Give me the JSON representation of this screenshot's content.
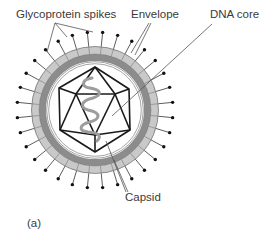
{
  "diagram": {
    "panel_label": "(a)",
    "labels": {
      "glycoprotein_spikes": "Glycoprotein spikes",
      "envelope": "Envelope",
      "dna_core": "DNA core",
      "capsid": "Capsid"
    },
    "components": [
      {
        "id": "glycoprotein-spikes",
        "label": "Glycoprotein spikes",
        "count": 32
      },
      {
        "id": "envelope",
        "label": "Envelope"
      },
      {
        "id": "capsid",
        "label": "Capsid",
        "shape": "icosahedron"
      },
      {
        "id": "dna-core",
        "label": "DNA core"
      }
    ],
    "colors": {
      "outline": "#1a1a1a",
      "envelope_outer": "#c9c9c9",
      "envelope_inner": "#8c8c8c",
      "membrane_line": "#9a9a9a",
      "dna": "#9d9d9d",
      "leader": "#555555",
      "text": "#3a3a3a"
    }
  }
}
